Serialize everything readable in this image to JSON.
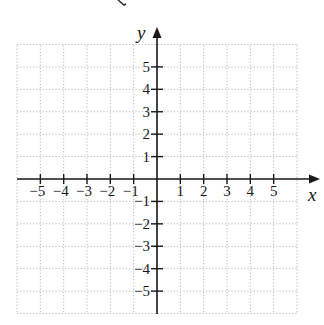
{
  "diagram": {
    "type": "coordinate-plane",
    "axes": {
      "x_label": "x",
      "y_label": "y"
    },
    "x_range": [
      -6,
      6
    ],
    "y_range": [
      -6,
      6
    ],
    "grid": {
      "style": "dotted",
      "color": "#b8b8b8",
      "visible": true
    },
    "x_ticks": [
      {
        "value": -5,
        "label": "−5"
      },
      {
        "value": -4,
        "label": "−4"
      },
      {
        "value": -3,
        "label": "−3"
      },
      {
        "value": -2,
        "label": "−2"
      },
      {
        "value": -1,
        "label": "−1"
      },
      {
        "value": 1,
        "label": "1"
      },
      {
        "value": 2,
        "label": "2"
      },
      {
        "value": 3,
        "label": "3"
      },
      {
        "value": 4,
        "label": "4"
      },
      {
        "value": 5,
        "label": "5"
      }
    ],
    "y_ticks": [
      {
        "value": 5,
        "label": "5"
      },
      {
        "value": 4,
        "label": "4"
      },
      {
        "value": 3,
        "label": "3"
      },
      {
        "value": 2,
        "label": "2"
      },
      {
        "value": 1,
        "label": "1"
      },
      {
        "value": -1,
        "label": "−1"
      },
      {
        "value": -2,
        "label": "−2"
      },
      {
        "value": -3,
        "label": "−3"
      },
      {
        "value": -4,
        "label": "−4"
      },
      {
        "value": -5,
        "label": "−5"
      }
    ],
    "colors": {
      "axis": "#1a1a1a",
      "grid": "#b8b8b8",
      "background": "#ffffff"
    }
  }
}
